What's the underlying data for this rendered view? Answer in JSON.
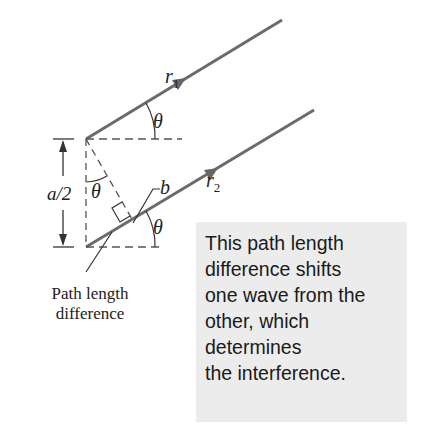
{
  "diagram": {
    "rays": [
      {
        "label": "r",
        "subscript": "1"
      },
      {
        "label": "r",
        "subscript": "2"
      }
    ],
    "angle_symbol": "θ",
    "separation_label": "a/2",
    "segment_label": "b",
    "path_label": {
      "line1": "Path length",
      "line2": "difference"
    },
    "callout": {
      "lines": [
        "This path length",
        "difference shifts",
        "one wave from the",
        "other, which",
        "determines",
        "the interference."
      ]
    },
    "colors": {
      "ray": "#6b6b6b",
      "callout_bg": "#ececec",
      "dash": "#555555"
    }
  }
}
